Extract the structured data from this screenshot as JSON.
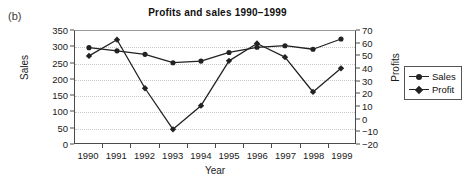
{
  "panel": {
    "label": "(b)"
  },
  "chart_data": {
    "type": "line",
    "title": "Profits and sales 1990−1999",
    "xlabel": "Year",
    "ylabel": "Sales",
    "y2label": "Profits",
    "categories": [
      "1990",
      "1991",
      "1992",
      "1993",
      "1994",
      "1995",
      "1996",
      "1997",
      "1998",
      "1999"
    ],
    "xticklabels": [
      "1990",
      "1991",
      "1992",
      "1993",
      "1994",
      "1995",
      "1996",
      "1997",
      "1998",
      "1999"
    ],
    "ylim": [
      0,
      350
    ],
    "yticks": [
      0,
      50,
      100,
      150,
      200,
      250,
      300,
      350
    ],
    "yticklabels": [
      "0",
      "50",
      "100",
      "150",
      "200",
      "250",
      "300",
      "350"
    ],
    "y2lim": [
      -20,
      70
    ],
    "y2ticks": [
      -20,
      -10,
      0,
      10,
      20,
      30,
      40,
      50,
      60,
      70
    ],
    "y2ticklabels": [
      "−20",
      "−10",
      "0",
      "10",
      "20",
      "30",
      "40",
      "50",
      "60",
      "70"
    ],
    "grid": "horizontal-dotted",
    "legend_position": "right-outside",
    "series": [
      {
        "name": "Sales",
        "axis": "left",
        "marker": "circle",
        "color": "#222222",
        "values": [
          298,
          288,
          277,
          251,
          256,
          283,
          299,
          304,
          293,
          325
        ]
      },
      {
        "name": "Profit",
        "axis": "right",
        "marker": "diamond",
        "color": "#222222",
        "values": [
          50,
          63,
          24,
          -9,
          10,
          46,
          60,
          49,
          21,
          40
        ]
      }
    ]
  },
  "legend": {
    "items": [
      {
        "label": "Sales",
        "marker": "circle"
      },
      {
        "label": "Profit",
        "marker": "diamond"
      }
    ]
  }
}
